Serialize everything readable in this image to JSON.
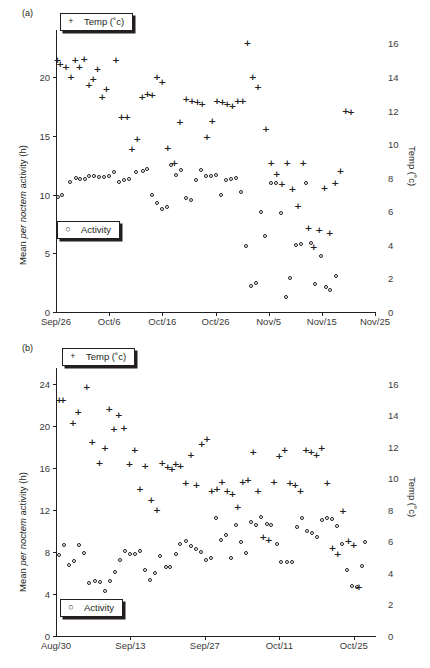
{
  "figure": {
    "panels": [
      {
        "id": "a",
        "label": "(a)",
        "ylabel_pre": "Mean ",
        "ylabel_it": "per noctem",
        "ylabel_post": " activity (h)",
        "ylabel_right": "Temp (˚c)",
        "legend_temp": "Temp (˚c)",
        "legend_activity": "Activity",
        "legend_temp_glyph": "plus-marker",
        "legend_activity_glyph": "open-circle-marker"
      },
      {
        "id": "b",
        "label": "(b)",
        "ylabel_pre": "Mean ",
        "ylabel_it": "per noctem",
        "ylabel_post": " activity (h)",
        "ylabel_right": "Temp (˚c)",
        "legend_temp": "Temp (˚c)",
        "legend_activity": "Activity",
        "legend_temp_glyph": "plus-marker",
        "legend_activity_glyph": "open-circle-marker"
      }
    ]
  },
  "chart_data": [
    {
      "type": "scatter",
      "panel": "a",
      "title": "",
      "xlabel": "",
      "ylabel": "Mean per noctem activity (h)",
      "ylabel_right": "Temp (˚c)",
      "grid": false,
      "legend_position": "inside-top-left / inside-middle-left",
      "xlim": [
        0,
        60
      ],
      "x_tick_positions": [
        0,
        10,
        20,
        30,
        40,
        50,
        60
      ],
      "x_tick_labels": [
        "Sep/26",
        "Oct/6",
        "Oct/16",
        "Oct/26",
        "Nov/5",
        "Nov/15",
        "Nov/25"
      ],
      "ylim": [
        0,
        24
      ],
      "y_tick_values": [
        0,
        5,
        10,
        15,
        20
      ],
      "ylim_right": [
        0,
        16.8
      ],
      "y_tick_values_right": [
        0,
        2,
        4,
        6,
        8,
        10,
        12,
        14,
        16
      ],
      "series": [
        {
          "name": "Activity",
          "marker": "open-circle",
          "axis": "left",
          "units": "h",
          "x": [
            0.4,
            1.2,
            2.6,
            3.7,
            4.5,
            5.4,
            6.3,
            7.2,
            8.1,
            9.0,
            10.0,
            11.0,
            11.9,
            12.8,
            13.8,
            15.1,
            16.3,
            17.2,
            18.1,
            19.0,
            19.9,
            20.9,
            21.6,
            22.6,
            23.5,
            24.5,
            25.4,
            26.3,
            27.2,
            28.2,
            29.1,
            30.1,
            31.0,
            32.0,
            32.9,
            33.8,
            34.8,
            35.7,
            36.6,
            37.6,
            38.5,
            39.4,
            40.4,
            41.3,
            42.3,
            43.2,
            44.1,
            45.1,
            46.0,
            47.0,
            47.9,
            48.8,
            49.8,
            50.7,
            51.6,
            52.6,
            53.5,
            54.5,
            55.4,
            56.3,
            57.3,
            58.2
          ],
          "y": [
            9.8,
            10.0,
            11.1,
            11.4,
            11.3,
            11.3,
            11.6,
            11.6,
            11.5,
            11.5,
            11.6,
            11.9,
            11.1,
            11.2,
            11.3,
            11.9,
            12.0,
            12.2,
            10.0,
            9.3,
            8.8,
            8.9,
            12.5,
            11.7,
            12.1,
            9.7,
            9.5,
            11.2,
            12.1,
            11.6,
            11.6,
            11.7,
            10.0,
            11.2,
            11.3,
            11.4,
            10.2,
            5.6,
            2.2,
            2.5,
            8.5,
            6.5,
            11.0,
            11.0,
            8.4,
            1.3,
            2.9,
            5.7,
            5.8,
            11.0,
            5.9,
            2.4,
            4.8,
            2.1,
            1.9,
            3.1
          ],
          "note": "Open-circle activity hours; declines sharply after Nov/5"
        },
        {
          "name": "Temp",
          "marker": "plus",
          "axis": "right",
          "units": "˚c",
          "x": [
            0.3,
            0.8,
            1.9,
            2.8,
            3.6,
            4.4,
            5.3,
            6.2,
            7.0,
            7.8,
            8.7,
            9.5,
            11.3,
            12.3,
            13.4,
            14.3,
            15.3,
            16.2,
            17.2,
            18.1,
            19.0,
            20.0,
            21.0,
            22.3,
            23.3,
            24.5,
            25.6,
            26.6,
            27.5,
            28.4,
            29.4,
            30.3,
            31.3,
            32.2,
            33.2,
            34.2,
            35.1,
            36.0,
            37.0,
            38.0,
            39.5,
            40.5,
            41.5,
            42.5,
            43.5,
            44.5,
            45.5,
            46.5,
            47.5,
            48.5,
            49.5,
            50.5,
            51.5,
            52.5,
            53.5,
            54.5,
            55.5,
            57.5,
            58.3
          ],
          "y": [
            15.0,
            14.8,
            14.6,
            14.0,
            15.0,
            14.6,
            15.1,
            13.5,
            13.9,
            14.5,
            12.8,
            13.3,
            15.0,
            11.6,
            11.6,
            9.7,
            10.3,
            12.8,
            13.0,
            12.9,
            14.0,
            13.7,
            9.8,
            8.9,
            11.3,
            12.7,
            12.6,
            12.5,
            12.4,
            10.4,
            11.4,
            12.6,
            12.5,
            12.4,
            12.3,
            12.6,
            12.6,
            16.0,
            14.0,
            13.4,
            10.9,
            8.9,
            8.2,
            7.6,
            8.9,
            7.3,
            6.3,
            8.9,
            5.0,
            3.9,
            4.9,
            7.4,
            4.7,
            7.7,
            8.4,
            12.0,
            11.9
          ],
          "note": "Plus-marker temperatures on right axis; warm ~15 in late Sep, dropping below 5 in mid Nov"
        }
      ]
    },
    {
      "type": "scatter",
      "panel": "b",
      "title": "",
      "xlabel": "",
      "ylabel": "Mean per noctem activity (h)",
      "ylabel_right": "Temp (˚c)",
      "grid": false,
      "legend_position": "inside-top-left / inside-bottom-left",
      "xlim": [
        0,
        60
      ],
      "x_tick_positions": [
        0,
        14,
        28,
        42,
        56
      ],
      "x_tick_labels": [
        "Aug/30",
        "Sep/13",
        "Sep/27",
        "Oct/11",
        "Oct/25"
      ],
      "ylim": [
        0,
        25.5
      ],
      "y_tick_values": [
        0,
        4,
        8,
        12,
        16,
        20,
        24
      ],
      "ylim_right": [
        0,
        17
      ],
      "y_tick_values_right": [
        0,
        2,
        4,
        6,
        8,
        10,
        12,
        14,
        16
      ],
      "series": [
        {
          "name": "Activity",
          "marker": "open-circle",
          "axis": "left",
          "units": "h",
          "x": [
            0.5,
            1.5,
            2.5,
            3.4,
            4.4,
            5.3,
            6.3,
            7.3,
            8.2,
            9.2,
            10.1,
            11.1,
            12.0,
            13.0,
            13.9,
            14.9,
            15.8,
            16.8,
            17.7,
            18.7,
            19.6,
            20.6,
            21.5,
            22.5,
            23.4,
            24.4,
            25.3,
            26.3,
            27.2,
            28.2,
            29.1,
            30.1,
            31.0,
            32.0,
            32.9,
            33.9,
            34.8,
            35.8,
            36.7,
            37.7,
            38.6,
            39.6,
            40.5,
            41.5,
            42.4,
            43.4,
            44.3,
            45.3,
            46.2,
            47.2,
            48.1,
            49.1,
            50.0,
            51.0,
            51.9,
            52.9,
            53.8,
            54.8,
            55.7,
            56.7,
            57.6,
            58.1
          ],
          "y": [
            7.7,
            8.7,
            6.8,
            7.1,
            8.7,
            7.9,
            5.0,
            5.2,
            5.1,
            4.3,
            5.2,
            6.1,
            7.2,
            8.1,
            7.8,
            7.8,
            8.1,
            6.3,
            5.3,
            6.0,
            7.6,
            6.6,
            6.6,
            7.8,
            8.8,
            9.0,
            8.6,
            8.3,
            8.0,
            7.2,
            7.4,
            11.2,
            9.1,
            9.6,
            7.4,
            10.6,
            8.9,
            7.9,
            10.8,
            10.6,
            11.3,
            10.7,
            10.6,
            8.8,
            7.0,
            7.0,
            7.0,
            10.4,
            11.2,
            10.0,
            9.8,
            9.4,
            11.0,
            11.2,
            11.1,
            10.5,
            8.8,
            6.3,
            4.8,
            4.7,
            6.7,
            8.9,
            8.5,
            8.2
          ],
          "note": "Activity hours rise from ~5 in early Sep to ~11 mid Oct then fall"
        },
        {
          "name": "Temp",
          "marker": "plus",
          "axis": "right",
          "units": "˚c",
          "x": [
            0.6,
            1.3,
            3.2,
            4.2,
            5.8,
            6.8,
            8.2,
            9.2,
            10.0,
            10.9,
            11.8,
            12.8,
            13.8,
            14.8,
            15.8,
            16.8,
            17.9,
            19.0,
            20.0,
            21.0,
            21.8,
            22.5,
            23.4,
            24.4,
            25.4,
            26.4,
            27.4,
            28.4,
            29.3,
            30.3,
            31.2,
            32.2,
            33.2,
            34.2,
            35.1,
            36.1,
            37.1,
            38.0,
            39.0,
            40.0,
            41.0,
            42.0,
            43.0,
            44.0,
            45.0,
            46.0,
            47.0,
            48.0,
            49.0,
            50.0,
            51.0,
            52.0,
            53.0,
            54.0,
            55.0,
            56.0,
            57.0,
            57.6,
            58.2
          ],
          "y": [
            15.0,
            15.0,
            13.5,
            14.2,
            15.8,
            12.3,
            11.0,
            11.9,
            14.4,
            13.1,
            14.0,
            13.2,
            10.9,
            11.8,
            9.3,
            10.8,
            8.6,
            8.0,
            11.0,
            10.7,
            10.6,
            10.9,
            10.8,
            9.7,
            11.5,
            9.6,
            12.2,
            12.5,
            9.2,
            9.3,
            9.8,
            9.2,
            9.0,
            8.2,
            9.8,
            9.9,
            11.7,
            9.2,
            6.3,
            6.1,
            9.8,
            11.4,
            11.8,
            9.7,
            9.6,
            9.2,
            11.8,
            11.7,
            11.5,
            11.9,
            9.7,
            5.6,
            5.2,
            7.9,
            6.0,
            5.8,
            3.1
          ],
          "note": "Plus-marker temperature, right axis, slow decline from ~15 to ~3"
        }
      ]
    }
  ]
}
